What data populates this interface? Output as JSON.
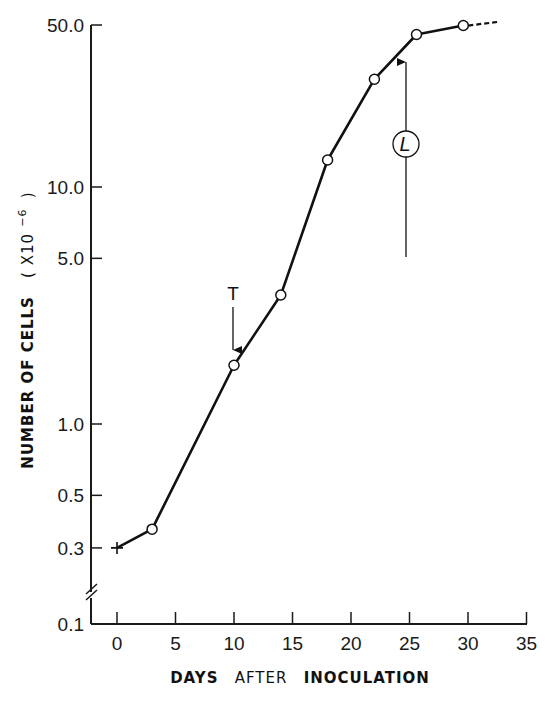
{
  "chart_data": {
    "type": "line",
    "title": "",
    "xlabel": "DAYS AFTER INOCULATION",
    "ylabel": "NUMBER OF CELLS ( X10^-6 )",
    "ylabel_parts": {
      "main": "NUMBER  OF  CELLS",
      "unit_open": "( X10",
      "unit_exp": "−6",
      "unit_close": ")"
    },
    "xlabel_parts": [
      "DAYS",
      "AFTER",
      "INOCULATION"
    ],
    "x_scale": "linear",
    "y_scale": "log",
    "xlim": [
      0,
      35
    ],
    "ylim": [
      0.1,
      50.0
    ],
    "x_ticks": [
      0,
      5,
      10,
      15,
      20,
      25,
      30,
      35
    ],
    "x_tick_labels": [
      "0",
      "5",
      "10",
      "15",
      "20",
      "25",
      "30",
      "35"
    ],
    "y_ticks": [
      0.1,
      0.3,
      0.5,
      1.0,
      5.0,
      10.0,
      50.0
    ],
    "y_tick_labels": [
      "0.1",
      "0.3",
      "0.5",
      "1.0",
      "5.0",
      "10.0",
      "50.0"
    ],
    "y_axis_break": true,
    "grid": false,
    "legend": null,
    "series": [
      {
        "name": "cell growth",
        "x": [
          0,
          3,
          10,
          14,
          18,
          22,
          25.6,
          29.6
        ],
        "y": [
          0.3,
          0.36,
          1.77,
          3.5,
          13,
          28.5,
          44,
          48
        ],
        "markers": [
          "plus",
          "open-circle",
          "open-circle",
          "open-circle",
          "open-circle",
          "open-circle",
          "open-circle",
          "open-circle"
        ],
        "dashed_extension": {
          "x": [
            29.6,
            32.5
          ],
          "y": [
            48,
            50
          ]
        }
      }
    ],
    "annotations": [
      {
        "label": "T",
        "type": "down-arrow",
        "x": 10,
        "y_from": 3.6,
        "y_to": 2.0
      },
      {
        "label": "L",
        "type": "up-arrow",
        "circled": true,
        "x": 24.7,
        "y_from": 5.0,
        "y_to": 39
      }
    ]
  }
}
